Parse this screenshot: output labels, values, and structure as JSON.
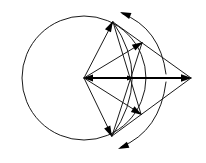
{
  "figure": {
    "canvas": {
      "width": 206,
      "height": 163,
      "background": "#ffffff"
    },
    "stroke_color": "#1a1a1a",
    "accent_color": "#000000"
  },
  "geometry": {
    "circle": {
      "label": "main-circle",
      "cx": 84,
      "cy": 78,
      "r": 62
    },
    "center_point": {
      "label": "center-vertex",
      "x": 84,
      "y": 78
    },
    "vertices": {
      "top": {
        "label": "top-vertex",
        "x": 113,
        "y": 22
      },
      "bottom": {
        "label": "bottom-vertex",
        "x": 112,
        "y": 136
      },
      "right_apex": {
        "label": "right-apex",
        "x": 191,
        "y": 78
      },
      "upper_mid": {
        "label": "upper-mid-vertex",
        "x": 142,
        "y": 43
      },
      "lower_mid": {
        "label": "lower-mid-vertex",
        "x": 141,
        "y": 114
      }
    },
    "inner_arc": {
      "label": "inner-arc",
      "from_x": 113,
      "from_y": 22,
      "to_x": 112,
      "to_y": 136,
      "bulge_x": 147,
      "bulge_y": 78
    },
    "horizontal_axis": {
      "label": "horizontal-axis-arrow",
      "from_x": 84,
      "from_y": 78,
      "to_x": 191,
      "to_y": 78,
      "mid_marker_x": 132
    },
    "rotation_arc_top": {
      "label": "rotation-arc-top",
      "start_x": 166,
      "start_y": 74,
      "end_x": 121,
      "end_y": 13,
      "control_x": 160,
      "control_y": 28
    },
    "rotation_arc_bottom": {
      "label": "rotation-arc-bottom",
      "start_x": 166,
      "start_y": 82,
      "end_x": 120,
      "end_y": 148,
      "control_x": 160,
      "control_y": 131
    }
  },
  "markers": {
    "center_arrow": "arrowhead-left-at-center",
    "right_arrow": "arrowhead-right-at-apex",
    "top_vertex_arrow": "arrowhead-up-at-top-vertex",
    "bottom_vertex_arrow": "arrowhead-down-at-bottom-vertex",
    "upper_mid_arrow": "arrowhead-at-upper-mid",
    "lower_mid_arrow": "arrowhead-at-lower-mid",
    "rotation_top_arrow": "arrowhead-ccw-top",
    "rotation_bottom_arrow": "arrowhead-cw-bottom"
  }
}
